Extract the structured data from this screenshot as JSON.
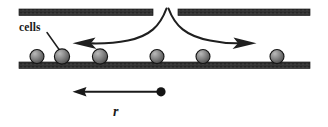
{
  "figure": {
    "background_color": "#ffffff",
    "ink_color": "#262626",
    "bar_color": "#333333",
    "sphere_fill": "#737373",
    "sphere_edge": "#1a1a1a",
    "sphere_highlight": "#b3b3b3"
  },
  "labels": {
    "cells": "cells",
    "radial_distance": "r"
  },
  "diagram_data": {
    "type": "schematic",
    "upper_plates": [
      {
        "name": "upper-plate-left",
        "x1": 19,
        "x2": 153,
        "y": 9,
        "thickness": 6
      },
      {
        "name": "upper-plate-right",
        "x1": 178,
        "x2": 310,
        "y": 9,
        "thickness": 6
      }
    ],
    "substrate": {
      "name": "substrate-plate",
      "x1": 19,
      "x2": 310,
      "y": 62,
      "thickness": 6
    },
    "gap": {
      "center_x": 167,
      "width": 25
    },
    "flow_arrows": [
      {
        "name": "flow-arrow-left",
        "apex_x": 166,
        "apex_y": 8,
        "tip_x": 73,
        "tip_y": 43,
        "direction": "left"
      },
      {
        "name": "flow-arrow-right",
        "apex_x": 168,
        "apex_y": 8,
        "tip_x": 256,
        "tip_y": 43,
        "direction": "right"
      }
    ],
    "cells": [
      {
        "index": 1,
        "cx": 37,
        "cy": 57,
        "r": 7
      },
      {
        "index": 2,
        "cx": 62,
        "cy": 57,
        "r": 7.5
      },
      {
        "index": 3,
        "cx": 100,
        "cy": 57,
        "r": 7.5
      },
      {
        "index": 4,
        "cx": 157,
        "cy": 57,
        "r": 7
      },
      {
        "index": 5,
        "cx": 203,
        "cy": 57,
        "r": 7
      },
      {
        "index": 6,
        "cx": 277,
        "cy": 57,
        "r": 7
      }
    ],
    "leader_line": {
      "name": "cells-leader-line",
      "x1": 47,
      "y1": 33,
      "x2": 60,
      "y2": 51
    },
    "measure_arrow": {
      "name": "radial-distance-arrow",
      "origin_x": 161,
      "origin_y": 92,
      "tip_x": 73,
      "tip_y": 92,
      "origin_dot_radius": 4.5,
      "label_x": 118,
      "label_y": 113
    }
  }
}
